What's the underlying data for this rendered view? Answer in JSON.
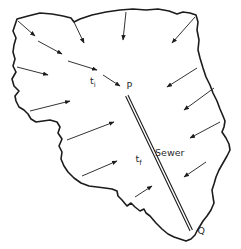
{
  "colors": {
    "background": "#ffffff",
    "line": "#1c1c1c",
    "text": "#2b2b2b"
  },
  "labels": {
    "inlet_time": {
      "base": "t",
      "sub": "i"
    },
    "point_p": "P",
    "sewer": "Sewer",
    "flow_time": {
      "base": "t",
      "sub": "f"
    },
    "outlet": "Q"
  },
  "diagram": {
    "boundary_points": [
      [
        17,
        19
      ],
      [
        28,
        16
      ],
      [
        40,
        13
      ],
      [
        52,
        14
      ],
      [
        63,
        16
      ],
      [
        71,
        18
      ],
      [
        74,
        22
      ],
      [
        80,
        19
      ],
      [
        92,
        15
      ],
      [
        106,
        12
      ],
      [
        120,
        10
      ],
      [
        133,
        9
      ],
      [
        146,
        10
      ],
      [
        158,
        9
      ],
      [
        169,
        11
      ],
      [
        177,
        14
      ],
      [
        183,
        12
      ],
      [
        190,
        13
      ],
      [
        196,
        15
      ],
      [
        198,
        22
      ],
      [
        197,
        30
      ],
      [
        199,
        40
      ],
      [
        198,
        50
      ],
      [
        200,
        58
      ],
      [
        203,
        68
      ],
      [
        206,
        77
      ],
      [
        210,
        85
      ],
      [
        213,
        93
      ],
      [
        217,
        101
      ],
      [
        220,
        109
      ],
      [
        223,
        116
      ],
      [
        225,
        121
      ],
      [
        224,
        127
      ],
      [
        222,
        132
      ],
      [
        226,
        138
      ],
      [
        229,
        144
      ],
      [
        230,
        150
      ],
      [
        227,
        156
      ],
      [
        223,
        163
      ],
      [
        219,
        170
      ],
      [
        216,
        177
      ],
      [
        214,
        184
      ],
      [
        212,
        190
      ],
      [
        213,
        197
      ],
      [
        214,
        203
      ],
      [
        211,
        210
      ],
      [
        207,
        216
      ],
      [
        203,
        221
      ],
      [
        200,
        226
      ],
      [
        197,
        231
      ],
      [
        195,
        235
      ],
      [
        191,
        239
      ],
      [
        186,
        241
      ],
      [
        180,
        239
      ],
      [
        174,
        237
      ],
      [
        168,
        234
      ],
      [
        162,
        229
      ],
      [
        156,
        223
      ],
      [
        150,
        216
      ],
      [
        146,
        213
      ],
      [
        144,
        209
      ],
      [
        140,
        211
      ],
      [
        135,
        207
      ],
      [
        131,
        203
      ],
      [
        127,
        206
      ],
      [
        122,
        200
      ],
      [
        118,
        196
      ],
      [
        117,
        191
      ],
      [
        112,
        189
      ],
      [
        105,
        188
      ],
      [
        97,
        187
      ],
      [
        89,
        186
      ],
      [
        81,
        183
      ],
      [
        74,
        178
      ],
      [
        68,
        172
      ],
      [
        64,
        166
      ],
      [
        61,
        159
      ],
      [
        62,
        152
      ],
      [
        59,
        146
      ],
      [
        62,
        139
      ],
      [
        58,
        133
      ],
      [
        60,
        127
      ],
      [
        57,
        122
      ],
      [
        50,
        120
      ],
      [
        43,
        121
      ],
      [
        36,
        122
      ],
      [
        31,
        119
      ],
      [
        28,
        114
      ],
      [
        24,
        110
      ],
      [
        19,
        107
      ],
      [
        16,
        101
      ],
      [
        15,
        96
      ],
      [
        19,
        91
      ],
      [
        14,
        86
      ],
      [
        12,
        79
      ],
      [
        16,
        72
      ],
      [
        13,
        66
      ],
      [
        15,
        59
      ],
      [
        13,
        52
      ],
      [
        14,
        45
      ],
      [
        16,
        38
      ],
      [
        13,
        31
      ],
      [
        15,
        25
      ]
    ],
    "flow_arrows": [
      [
        18,
        21,
        35,
        36
      ],
      [
        73,
        20,
        84,
        43
      ],
      [
        126,
        12,
        123,
        40
      ],
      [
        195,
        17,
        172,
        43
      ],
      [
        17,
        67,
        48,
        75
      ],
      [
        30,
        111,
        70,
        101
      ],
      [
        67,
        140,
        114,
        122
      ],
      [
        82,
        176,
        117,
        161
      ],
      [
        135,
        197,
        152,
        186
      ],
      [
        197,
        68,
        167,
        87
      ],
      [
        214,
        88,
        184,
        110
      ],
      [
        220,
        122,
        190,
        138
      ],
      [
        206,
        162,
        184,
        177
      ]
    ],
    "overland_flow_arrows": [
      [
        38,
        41,
        62,
        54
      ],
      [
        68,
        61,
        97,
        70
      ],
      [
        103,
        75,
        120,
        86
      ]
    ],
    "sewer_line": {
      "from": [
        127,
        96
      ],
      "to": [
        191,
        230
      ],
      "double_line_gap": 2.6
    }
  }
}
